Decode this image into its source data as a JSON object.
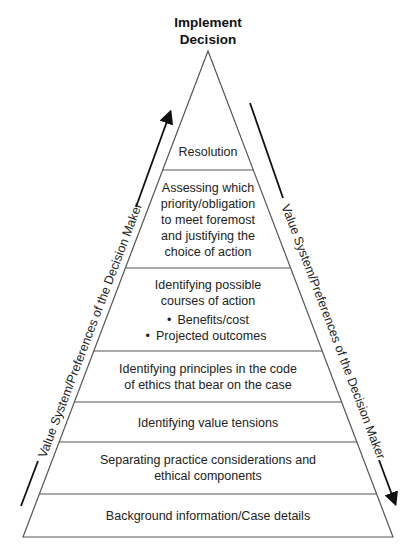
{
  "diagram": {
    "apex_label": "Implement Decision",
    "apex_label_lines": [
      "Implement",
      "Decision"
    ],
    "levels": [
      {
        "id": "resolution",
        "lines": [
          "Resolution"
        ]
      },
      {
        "id": "assessing",
        "lines": [
          "Assessing which",
          "priority/obligation",
          "to meet foremost",
          "and justifying the",
          "choice of action"
        ]
      },
      {
        "id": "possible-courses",
        "lines": [
          "Identifying possible",
          "courses of action"
        ],
        "bullets": [
          "Benefits/cost",
          "Projected outcomes"
        ]
      },
      {
        "id": "principles",
        "lines": [
          "Identifying principles in the code",
          "of ethics that bear on the case"
        ]
      },
      {
        "id": "value-tensions",
        "lines": [
          "Identifying value tensions"
        ]
      },
      {
        "id": "separating",
        "lines": [
          "Separating practice considerations and",
          "ethical components"
        ]
      },
      {
        "id": "background",
        "lines": [
          "Background information/Case details"
        ]
      }
    ],
    "left_side_label": "Value System/Preferences of the Decision Maker",
    "right_side_label": "Value System/Preferences of the Decision Maker",
    "left_arrow_direction": "up",
    "right_arrow_direction": "down",
    "colors": {
      "lines": "#555555",
      "text": "#222222",
      "arrows": "#111111",
      "background": "#ffffff"
    }
  }
}
